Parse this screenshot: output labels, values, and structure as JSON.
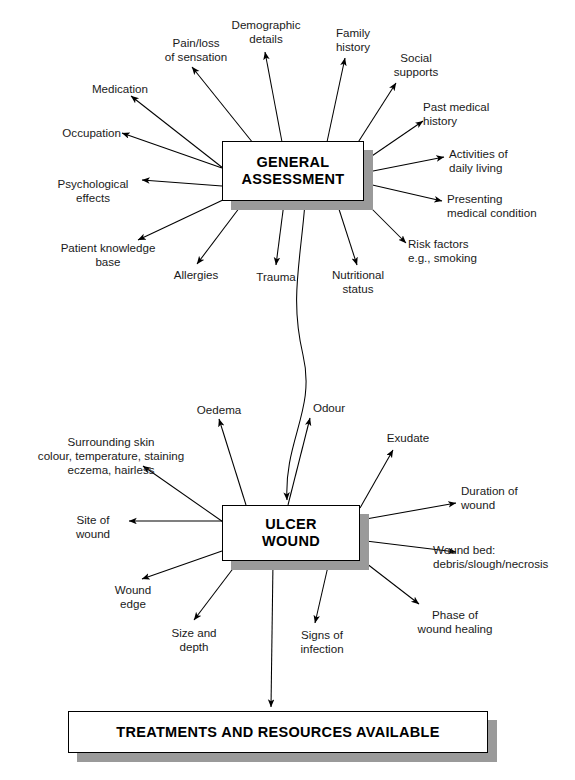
{
  "diagram": {
    "nodes": {
      "general": "GENERAL\nASSESSMENT",
      "ulcer": "ULCER\nWOUND",
      "treatments": "TREATMENTS AND RESOURCES AVAILABLE"
    },
    "general_branches": [
      {
        "id": "medication",
        "label": "Medication"
      },
      {
        "id": "pain-loss-sensation",
        "label": "Pain/loss\nof sensation"
      },
      {
        "id": "demographic-details",
        "label": "Demographic\ndetails"
      },
      {
        "id": "family-history",
        "label": "Family\nhistory"
      },
      {
        "id": "social-supports",
        "label": "Social\nsupports"
      },
      {
        "id": "past-medical-history",
        "label": "Past medical\nhistory"
      },
      {
        "id": "activities-daily-living",
        "label": "Activities of\ndaily living"
      },
      {
        "id": "presenting-medical-condition",
        "label": "Presenting\nmedical condition"
      },
      {
        "id": "risk-factors",
        "label": "Risk factors\ne.g., smoking"
      },
      {
        "id": "nutritional-status",
        "label": "Nutritional\nstatus"
      },
      {
        "id": "trauma",
        "label": "Trauma"
      },
      {
        "id": "allergies",
        "label": "Allergies"
      },
      {
        "id": "patient-knowledge-base",
        "label": "Patient knowledge\nbase"
      },
      {
        "id": "psychological-effects",
        "label": "Psychological\neffects"
      },
      {
        "id": "occupation",
        "label": "Occupation"
      }
    ],
    "ulcer_branches": [
      {
        "id": "surrounding-skin",
        "label": "Surrounding skin\ncolour, temperature, staining\neczema, hairless"
      },
      {
        "id": "oedema",
        "label": "Oedema"
      },
      {
        "id": "odour",
        "label": "Odour"
      },
      {
        "id": "exudate",
        "label": "Exudate"
      },
      {
        "id": "duration-of-wound",
        "label": "Duration of\nwound"
      },
      {
        "id": "wound-bed",
        "label": "Wound bed:\ndebris/slough/necrosis"
      },
      {
        "id": "phase-of-wound-healing",
        "label": "Phase of\nwound healing"
      },
      {
        "id": "signs-of-infection",
        "label": "Signs of\ninfection"
      },
      {
        "id": "size-and-depth",
        "label": "Size and\ndepth"
      },
      {
        "id": "wound-edge",
        "label": "Wound\nedge"
      },
      {
        "id": "site-of-wound",
        "label": "Site of\nwound"
      }
    ],
    "colors": {
      "stroke": "#000000",
      "shadow": "#9a9a9a",
      "background": "#ffffff"
    }
  }
}
